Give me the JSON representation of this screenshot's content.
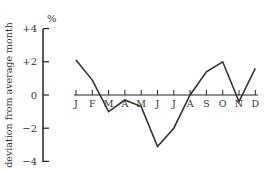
{
  "chart_data": {
    "type": "line",
    "title": "",
    "xlabel": "",
    "ylabel": "deviation from average month",
    "yunit": "%",
    "categories": [
      "J",
      "F",
      "M",
      "A",
      "M",
      "J",
      "J",
      "A",
      "S",
      "O",
      "N",
      "D"
    ],
    "values": [
      2.1,
      0.9,
      -1.0,
      -0.3,
      -0.7,
      -3.1,
      -2.0,
      0.0,
      1.4,
      2.0,
      -0.4,
      1.6
    ],
    "ylim": [
      -4,
      4
    ],
    "yticks": [
      "+4",
      "+2",
      "0",
      "−2",
      "−4"
    ],
    "grid": false,
    "legend": null,
    "line_color": "#333333"
  }
}
